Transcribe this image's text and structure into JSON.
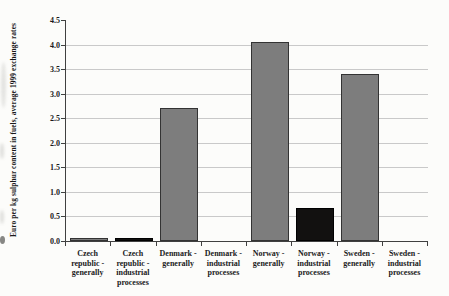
{
  "chart_data": {
    "type": "bar",
    "title": "",
    "xlabel": "",
    "ylabel": "Euro per kg sulphur content in fuels, average 1999 exchange rates",
    "ylim": [
      0,
      4.5
    ],
    "ytick_step": 0.5,
    "yticks": [
      "0.0",
      "0.5",
      "1.0",
      "1.5",
      "2.0",
      "2.5",
      "3.0",
      "3.5",
      "4.0",
      "4.5"
    ],
    "grid": "horizontal",
    "legend": "none",
    "categories": [
      "Czech\nrepublic -\ngenerally",
      "Czech\nrepublic -\nindustrial\nprocesses",
      "Denmark -\ngenerally",
      "Denmark -\nindustrial\nprocesses",
      "Norway -\ngenerally",
      "Norway -\nindustrial\nprocesses",
      "Sweden -\ngenerally",
      "Sweden -\nindustrial\nprocesses"
    ],
    "values": [
      0.06,
      0.06,
      2.7,
      0,
      4.05,
      0.68,
      3.4,
      0
    ],
    "bar_styles": [
      "gray",
      "black",
      "gray",
      "gray",
      "gray",
      "black",
      "gray",
      "gray"
    ],
    "colors": {
      "gray_fill": "#7d7d7d",
      "gray_border": "#333333",
      "black_fill": "#121110",
      "black_border": "#000000",
      "gridline": "#c9c9c9",
      "axis": "#404040",
      "text": "#1a1a1a",
      "background": "#fcfcfa"
    }
  }
}
